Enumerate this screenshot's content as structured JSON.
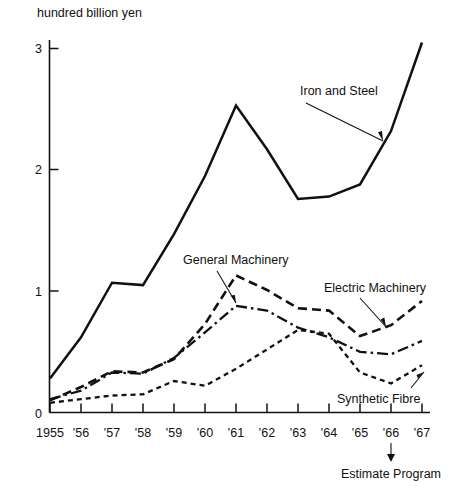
{
  "chart_data": {
    "type": "line",
    "title": "",
    "subtitle": "",
    "ylabel": "hundred billion yen",
    "xlabel": "",
    "ylim": [
      0,
      3.2
    ],
    "yticks": [
      0,
      1,
      2,
      3
    ],
    "ytick_labels": [
      "0",
      "1",
      "2",
      "3"
    ],
    "grid": false,
    "legend_position": "inline-annotations",
    "categories": [
      1955,
      1956,
      1957,
      1958,
      1959,
      1960,
      1961,
      1962,
      1963,
      1964,
      1965,
      1966,
      1967
    ],
    "xtick_labels": [
      "1955",
      "'56",
      "'57",
      "'58",
      "'59",
      "'60",
      "'61",
      "'62",
      "'63",
      "'64",
      "'65",
      "'66",
      "'67"
    ],
    "series": [
      {
        "name": "Iron and Steel",
        "style": "solid",
        "values": [
          0.28,
          0.62,
          1.07,
          1.05,
          1.47,
          1.95,
          2.53,
          2.17,
          1.76,
          1.78,
          1.88,
          2.32,
          3.05
        ]
      },
      {
        "name": "General Machinery",
        "style": "dashed",
        "values": [
          0.1,
          0.21,
          0.34,
          0.33,
          0.44,
          0.73,
          1.13,
          1.01,
          0.86,
          0.84,
          0.63,
          0.72,
          0.92
        ]
      },
      {
        "name": "Electric Machinery",
        "style": "dash-dot",
        "values": [
          0.11,
          0.18,
          0.33,
          0.32,
          0.45,
          0.66,
          0.88,
          0.84,
          0.7,
          0.62,
          0.5,
          0.48,
          0.59
        ]
      },
      {
        "name": "Synthetic Fibre",
        "style": "dotted",
        "values": [
          0.08,
          0.11,
          0.14,
          0.15,
          0.26,
          0.22,
          0.36,
          0.52,
          0.68,
          0.65,
          0.33,
          0.24,
          0.39
        ]
      }
    ],
    "annotations": [
      {
        "text": "Iron and Steel",
        "points_to_year": 1966
      },
      {
        "text": "General Machinery",
        "points_to_year": 1960
      },
      {
        "text": "Electric Machinery",
        "points_to_year": 1966
      },
      {
        "text": "Synthetic Fibre",
        "points_to_year": 1967
      },
      {
        "text": "Estimate Program",
        "points_to_year": 1966
      }
    ]
  },
  "axis": {
    "y_title": "hundred billion yen",
    "y_labels": [
      "3",
      "2",
      "1",
      "0"
    ],
    "x_labels": [
      "1955",
      "'56",
      "'57",
      "'58",
      "'59",
      "'60",
      "'61",
      "'62",
      "'63",
      "'64",
      "'65",
      "'66",
      "'67"
    ]
  },
  "labels": {
    "iron_and_steel": "Iron and Steel",
    "general_machinery": "General Machinery",
    "electric_machinery": "Electric Machinery",
    "synthetic_fibre": "Synthetic Fibre",
    "estimate_program": "Estimate Program"
  },
  "colors": {
    "ink": "#111111",
    "background": "#ffffff"
  }
}
